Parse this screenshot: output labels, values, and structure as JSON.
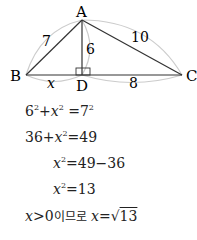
{
  "diagram": {
    "points": {
      "A": "A",
      "B": "B",
      "C": "C",
      "D": "D"
    },
    "labels": {
      "AB": "7",
      "AD": "6",
      "AC": "10",
      "BD": "x",
      "DC": "8"
    }
  },
  "equations": [
    {
      "id": "eq1",
      "text": "6²+x²=7²"
    },
    {
      "id": "eq2",
      "text": "36+x²=49"
    },
    {
      "id": "eq3",
      "text": "x²=49−36"
    },
    {
      "id": "eq4",
      "text": "x²=13"
    },
    {
      "id": "eq5",
      "prefix": "x>0이므로",
      "text": "x=√13"
    }
  ],
  "colors": {
    "line": "#333333",
    "arc": "#cccccc"
  }
}
